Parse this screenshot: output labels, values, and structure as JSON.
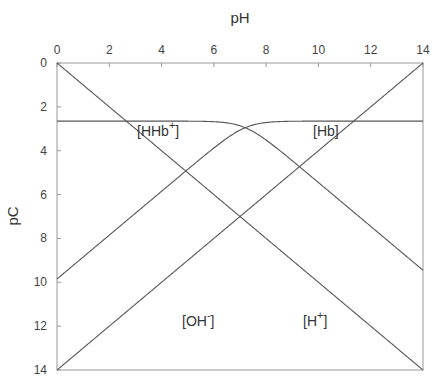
{
  "chart_data": {
    "type": "line",
    "title": "",
    "xlabel": "pH",
    "ylabel": "pC",
    "xlim": [
      0,
      14
    ],
    "ylim": [
      14,
      0
    ],
    "y_inverted": true,
    "x_axis_position": "top",
    "grid": false,
    "legend": "inline labels",
    "xticks": [
      0,
      2,
      4,
      6,
      8,
      10,
      12,
      14
    ],
    "yticks": [
      0,
      2,
      4,
      6,
      8,
      10,
      12,
      14
    ],
    "pKa": 7.2,
    "plateau_pC": 2.65,
    "series": [
      {
        "name": "[H+]",
        "label": "[H",
        "sup": "+",
        "close": "]",
        "description": "pC = pH",
        "x": [
          0,
          14
        ],
        "y": [
          0,
          14
        ]
      },
      {
        "name": "[OH-]",
        "label": "[OH",
        "sup": "-",
        "close": "]",
        "description": "pC = 14 - pH",
        "x": [
          0,
          14
        ],
        "y": [
          14,
          0
        ]
      },
      {
        "name": "[HHb+]",
        "label": "[HHb",
        "sup": "+",
        "close": "]",
        "description": "acid form; plateau at 2.65, slope -1 above pKa",
        "x": [
          0,
          2,
          4,
          6,
          7.2,
          8,
          10,
          12,
          14
        ],
        "y": [
          2.65,
          2.65,
          2.65,
          2.68,
          2.95,
          3.29,
          5.18,
          7.15,
          9.45
        ]
      },
      {
        "name": "[Hb]",
        "label": "[Hb",
        "sup": "",
        "close": "]",
        "description": "base form; slope +1 below pKa, plateau at 2.65",
        "x": [
          0,
          2,
          4,
          6,
          7.2,
          8,
          10,
          12,
          14
        ],
        "y": [
          9.85,
          7.85,
          5.85,
          3.89,
          2.95,
          2.81,
          2.66,
          2.65,
          2.65
        ]
      }
    ],
    "annotations": [
      {
        "text": "[HHb+]",
        "pH": 3.4,
        "pC": 2.4
      },
      {
        "text": "[Hb]",
        "pH": 10.3,
        "pC": 2.4
      },
      {
        "text": "[OH-]",
        "pH": 5.2,
        "pC": 12.3
      },
      {
        "text": "[H+]",
        "pH": 10.4,
        "pC": 12.3
      }
    ]
  },
  "axes": {
    "x_title": "pH",
    "y_title": "pC",
    "x_ticks": [
      "0",
      "2",
      "4",
      "6",
      "8",
      "10",
      "12",
      "14"
    ],
    "y_ticks": [
      "0",
      "2",
      "4",
      "6",
      "8",
      "10",
      "12",
      "14"
    ]
  },
  "labels": {
    "hhb": {
      "base": "[HHb",
      "sup": "+",
      "close": "]"
    },
    "hb": {
      "base": "[Hb",
      "close": "]"
    },
    "oh": {
      "base": "[OH",
      "sup": "-",
      "close": "]"
    },
    "h": {
      "base": "[H",
      "sup": "+",
      "close": "]"
    }
  },
  "colors": {
    "line": "#555555",
    "frame": "#999999",
    "text": "#333333"
  }
}
